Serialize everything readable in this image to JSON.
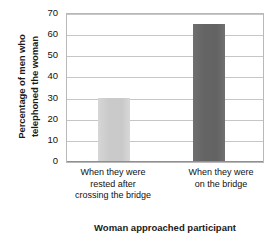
{
  "chart_data": {
    "type": "bar",
    "title": "",
    "subtitle": "",
    "xlabel": "Woman approached participant",
    "ylabel_lines": [
      "Percentage of men who",
      "telephoned the woman"
    ],
    "ylabel": "Percentage of men who telephoned the woman",
    "categories": [
      "When they were rested after crossing the bridge",
      "When they were on the bridge"
    ],
    "category_lines": [
      [
        "When they were",
        "rested after",
        "crossing the bridge"
      ],
      [
        "When they were",
        "on the bridge"
      ]
    ],
    "values": [
      30,
      65
    ],
    "ylim": [
      0,
      70
    ],
    "yticks": [
      70,
      60,
      50,
      40,
      30,
      20,
      10,
      0
    ],
    "ytick_labels": [
      "70",
      "60",
      "50",
      "40",
      "30",
      "20",
      "10",
      "0"
    ],
    "grid": true,
    "grid_axis": "y",
    "legend": false,
    "legend_position": "none",
    "bar_colors": [
      "#c9c9c9",
      "#636363"
    ],
    "frame_color": "#b9b9b9",
    "gridline_color": "#c6c6c6"
  }
}
